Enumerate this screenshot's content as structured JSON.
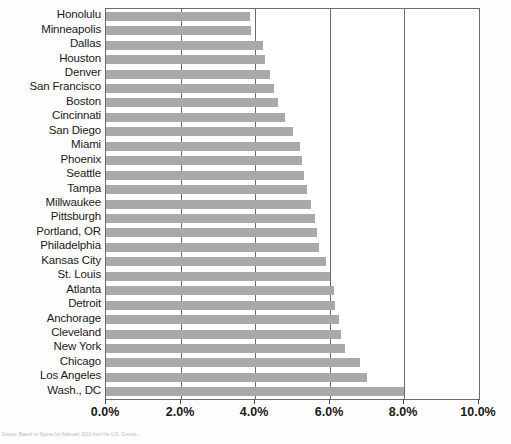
{
  "chart_data": {
    "type": "bar",
    "orientation": "horizontal",
    "title": "",
    "subtitle": "",
    "xlabel": "",
    "ylabel": "",
    "xlim": [
      0,
      10
    ],
    "xticks": [
      0,
      2,
      4,
      6,
      8,
      10
    ],
    "xtick_labels": [
      "0.0%",
      "2.0%",
      "4.0%",
      "6.0%",
      "8.0%",
      "10.0%"
    ],
    "grid": "vertical",
    "legend": "none",
    "bar_color": "#a9a9a9",
    "axis_color": "#6b6b6b",
    "sort_order": "ascending-from-top",
    "categories": [
      "Honolulu",
      "Minneapolis",
      "Dallas",
      "Houston",
      "Denver",
      "San Francisco",
      "Boston",
      "Cincinnati",
      "San Diego",
      "Miami",
      "Phoenix",
      "Seattle",
      "Tampa",
      "Millwaukee",
      "Pittsburgh",
      "Portland, OR",
      "Philadelphia",
      "Kansas City",
      "St. Louis",
      "Atlanta",
      "Detroit",
      "Anchorage",
      "Cleveland",
      "New York",
      "Chicago",
      "Los Angeles",
      "Wash., DC"
    ],
    "values": [
      3.85,
      3.9,
      4.2,
      4.25,
      4.4,
      4.5,
      4.6,
      4.8,
      5.0,
      5.2,
      5.25,
      5.3,
      5.4,
      5.5,
      5.6,
      5.65,
      5.7,
      5.9,
      6.0,
      6.1,
      6.15,
      6.25,
      6.3,
      6.4,
      6.8,
      7.0,
      8.0
    ],
    "value_unit": "%"
  },
  "source": {
    "note": "Source: Based on figures for February 2010 from the U.S. Census..."
  }
}
